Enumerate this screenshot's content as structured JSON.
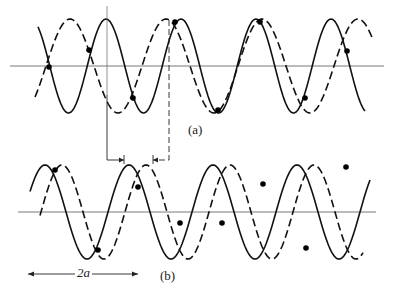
{
  "figure": {
    "panel_a": {
      "label": "(a)",
      "axis_y": 66,
      "axis_x_range": [
        10,
        384
      ],
      "amplitude": 47,
      "solid_wave": {
        "x_start": 38,
        "x_end": 365,
        "period": 75,
        "phase_peak_x": 106
      },
      "dashed_wave": {
        "x_start": 35,
        "x_end": 372,
        "period": 96,
        "phase_peak_x": 70
      },
      "dots": [
        [
          49,
          67
        ],
        [
          89,
          50
        ],
        [
          133,
          98
        ],
        [
          175,
          22
        ],
        [
          218,
          110
        ],
        [
          260,
          22
        ],
        [
          305,
          98
        ],
        [
          347,
          51
        ]
      ]
    },
    "panel_b": {
      "label": "(b)",
      "axis_y": 212,
      "axis_x_range": [
        18,
        376
      ],
      "amplitude": 47,
      "solid_wave": {
        "x_start": 30,
        "x_end": 370,
        "period": 84,
        "phase_peak_x": 45
      },
      "dashed_wave": {
        "x_start": 40,
        "x_end": 363,
        "period": 84,
        "phase_peak_x": 62
      },
      "dots": [
        [
          55,
          170
        ],
        [
          98,
          250
        ],
        [
          138,
          187
        ],
        [
          180,
          223
        ],
        [
          222,
          223
        ],
        [
          263,
          184
        ],
        [
          306,
          248
        ],
        [
          346,
          167
        ]
      ]
    },
    "connector": {
      "left_x": 107,
      "right_x": 169,
      "top_y": 95,
      "bottom_y": 160,
      "left_arrow_to": 124,
      "right_arrow_to": 153
    },
    "scale_bar": {
      "label": "2a",
      "x1": 28,
      "x2": 138,
      "y": 274
    }
  }
}
